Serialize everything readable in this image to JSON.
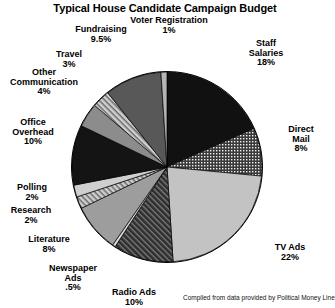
{
  "chart_data": {
    "type": "pie",
    "title": "Typical House Candidate Campaign Budget",
    "source_note": "Compiled from data provided by Political Money Line",
    "categories": [
      "Staff Salaries",
      "Direct Mail",
      "TV Ads",
      "Radio Ads",
      "Newspaper Ads",
      "Literature",
      "Research",
      "Polling",
      "Office Overhead",
      "Other Communication",
      "Travel",
      "Fundraising",
      "Voter Registration"
    ],
    "values": [
      18,
      8,
      22,
      10,
      0.5,
      8,
      2,
      2,
      10,
      4,
      3,
      9.5,
      1
    ],
    "value_labels": [
      "18%",
      "8%",
      "22%",
      "10%",
      ".5%",
      "8%",
      "2%",
      "2%",
      "10%",
      "4%",
      "3%",
      "9.5%",
      "1%"
    ],
    "xlabel": "",
    "ylabel": "",
    "legend": "none",
    "grid": false,
    "start_angle_deg": -90,
    "direction": "clockwise",
    "slices": [
      {
        "name": "Staff Salaries",
        "label": "Staff\nSalaries",
        "value": 18,
        "pct": "18%",
        "fill": "#111111",
        "pattern": "solid"
      },
      {
        "name": "Direct Mail",
        "label": "Direct\nMail",
        "value": 8,
        "pct": "8%",
        "fill": "#2b2b2b",
        "pattern": "dots"
      },
      {
        "name": "TV Ads",
        "label": "TV Ads",
        "value": 22,
        "pct": "22%",
        "fill": "#c3c3c3",
        "pattern": "solid"
      },
      {
        "name": "Radio Ads",
        "label": "Radio Ads",
        "value": 10,
        "pct": "10%",
        "fill": "#3a3a3a",
        "pattern": "diagonal"
      },
      {
        "name": "Newspaper Ads",
        "label": "Newspaper\nAds",
        "value": 0.5,
        "pct": ".5%",
        "fill": "#d8d8d8",
        "pattern": "solid"
      },
      {
        "name": "Literature",
        "label": "Literature",
        "value": 8,
        "pct": "8%",
        "fill": "#9d9d9d",
        "pattern": "solid"
      },
      {
        "name": "Research",
        "label": "Research",
        "value": 2,
        "pct": "2%",
        "fill": "#b9b9b9",
        "pattern": "diagonal-light"
      },
      {
        "name": "Polling",
        "label": "Polling",
        "value": 2,
        "pct": "2%",
        "fill": "#cfcfcf",
        "pattern": "solid"
      },
      {
        "name": "Office Overhead",
        "label": "Office\nOverhead",
        "value": 10,
        "pct": "10%",
        "fill": "#141414",
        "pattern": "solid"
      },
      {
        "name": "Other Communication",
        "label": "Other\nCommunication",
        "value": 4,
        "pct": "4%",
        "fill": "#8c8c8c",
        "pattern": "solid"
      },
      {
        "name": "Travel",
        "label": "Travel",
        "value": 3,
        "pct": "3%",
        "fill": "#b0b0b0",
        "pattern": "diagonal-light"
      },
      {
        "name": "Fundraising",
        "label": "Fundraising",
        "value": 9.5,
        "pct": "9.5%",
        "fill": "#585858",
        "pattern": "solid"
      },
      {
        "name": "Voter Registration",
        "label": "Voter Registration",
        "value": 1,
        "pct": "1%",
        "fill": "#b5b5b5",
        "pattern": "solid"
      }
    ]
  },
  "labels": {
    "title": "Typical House Candidate Campaign Budget",
    "voter_registration": "Voter Registration",
    "voter_registration_pct": "1%",
    "fundraising": "Fundraising",
    "fundraising_pct": "9.5%",
    "travel": "Travel",
    "travel_pct": "3%",
    "other_communication_l1": "Other",
    "other_communication_l2": "Communication",
    "other_communication_pct": "4%",
    "office_overhead_l1": "Office",
    "office_overhead_l2": "Overhead",
    "office_overhead_pct": "10%",
    "polling": "Polling",
    "polling_pct": "2%",
    "research": "Research",
    "research_pct": "2%",
    "literature": "Literature",
    "literature_pct": "8%",
    "newspaper_ads_l1": "Newspaper",
    "newspaper_ads_l2": "Ads",
    "newspaper_ads_pct": ".5%",
    "radio_ads": "Radio Ads",
    "radio_ads_pct": "10%",
    "tv_ads": "TV Ads",
    "tv_ads_pct": "22%",
    "direct_mail_l1": "Direct",
    "direct_mail_l2": "Mail",
    "direct_mail_pct": "8%",
    "staff_salaries_l1": "Staff",
    "staff_salaries_l2": "Salaries",
    "staff_salaries_pct": "18%",
    "credit": "Compiled from data provided by Political Money Line"
  }
}
